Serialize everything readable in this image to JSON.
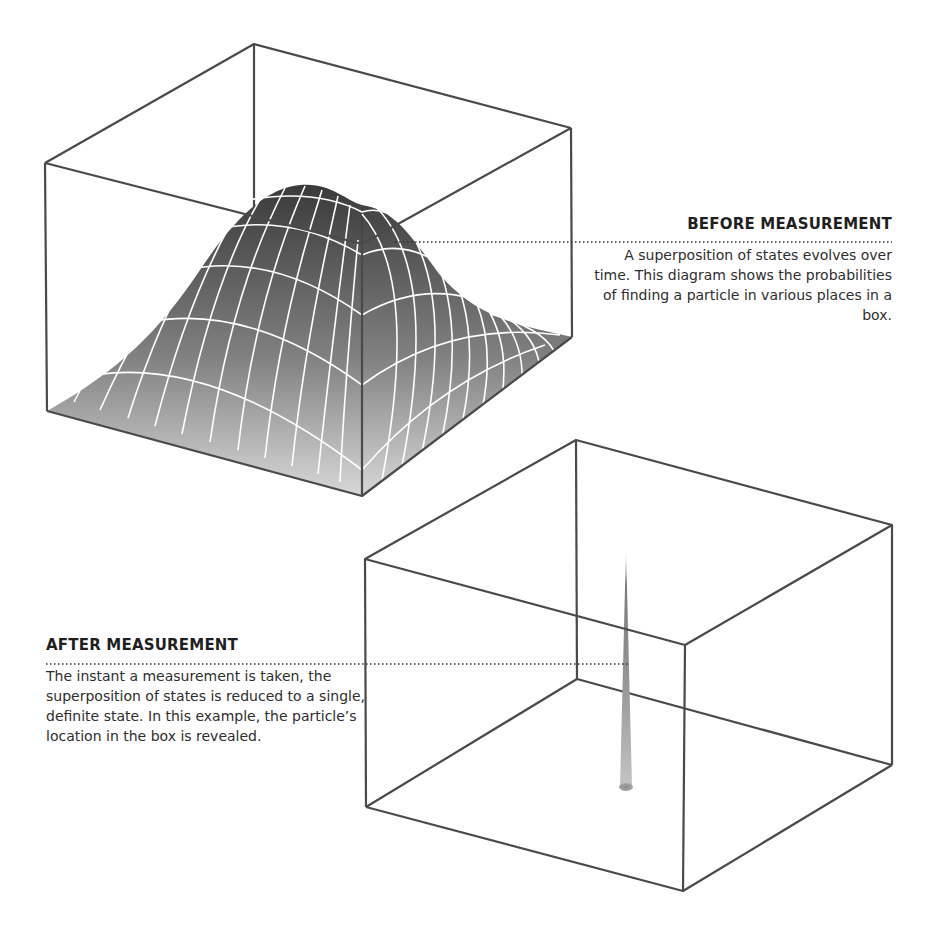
{
  "before": {
    "heading": "BEFORE MEASUREMENT",
    "body": "A superposition of states evolves over time. This diagram shows the probabilities of finding a particle in various places in a box."
  },
  "after": {
    "heading": "AFTER MEASUREMENT",
    "body": "The instant a measurement is taken, the superposition of states is reduced to a single, definite state. In this example, the particle’s location in the box is revealed."
  },
  "colors": {
    "box_edge": "#4a4a4a",
    "surface_top": "#3c3c3c",
    "surface_bottom": "#d6d6d6",
    "grid_line": "#ffffff",
    "leader_line": "#333333"
  }
}
